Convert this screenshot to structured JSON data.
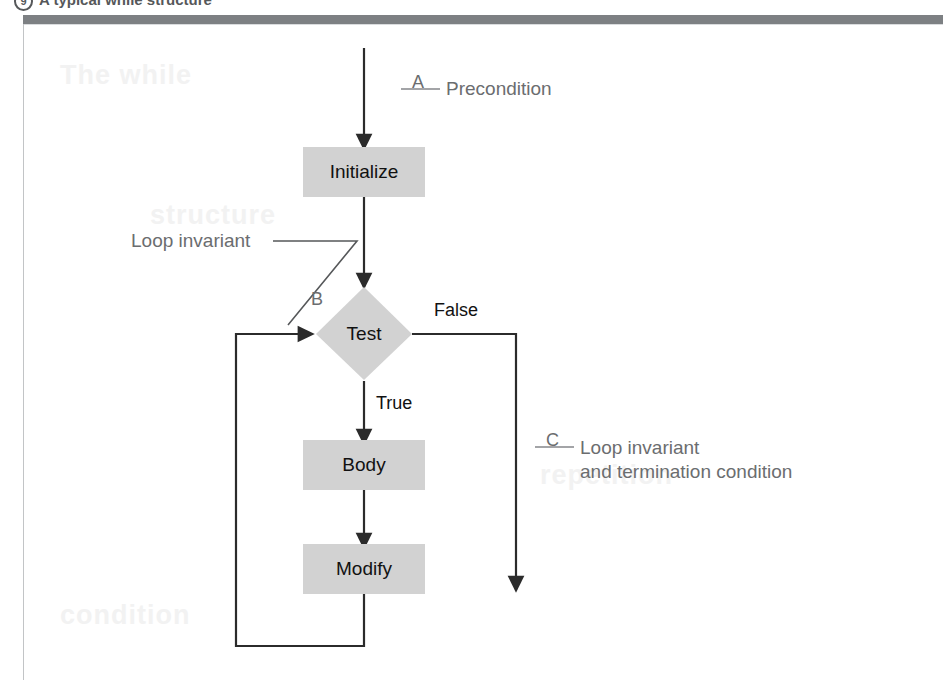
{
  "figure": {
    "caption_number": "9",
    "caption_title": "A typical while structure"
  },
  "nodes": {
    "initialize": "Initialize",
    "test": "Test",
    "body": "Body",
    "modify": "Modify"
  },
  "edge_labels": {
    "false": "False",
    "true": "True"
  },
  "callouts": {
    "a_letter": "A",
    "a_text": "Precondition",
    "b_letter": "B",
    "c_letter": "C",
    "c_text_line1": "Loop invariant",
    "c_text_line2": "and termination condition",
    "loop_invariant": "Loop invariant"
  },
  "colors": {
    "node_fill": "#d2d2d2",
    "rule": "#7d8083",
    "annotation_text": "#6b6d6f",
    "node_text": "#111111",
    "stroke": "#2b2b2b"
  },
  "bleed_through": {
    "line1": "The while",
    "line2": "structure",
    "line3": "repetition",
    "line4": "condition"
  }
}
